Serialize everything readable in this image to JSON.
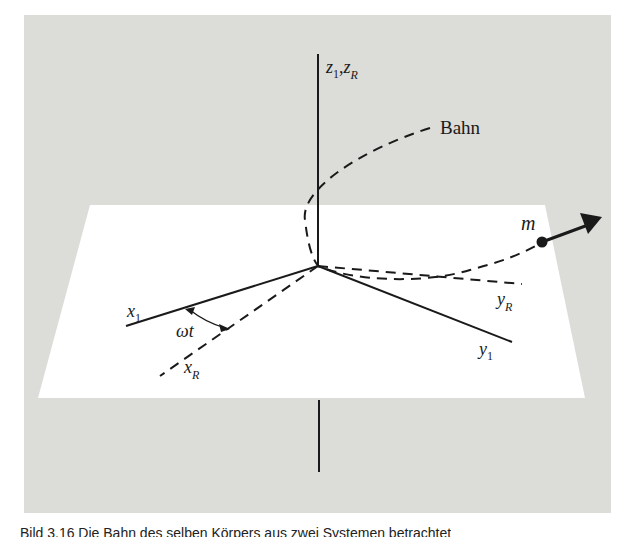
{
  "figure": {
    "background_color": "#dcdcd8",
    "plane_color": "#ffffff",
    "line_color": "#1a1a1a"
  },
  "labels": {
    "z_axis": {
      "main": "z",
      "sub1": "1",
      "sep": ",",
      "main2": "z",
      "sub2": "R"
    },
    "path": "Bahn",
    "mass": "m",
    "x1": {
      "main": "x",
      "sub": "1"
    },
    "xR": {
      "main": "x",
      "sub": "R"
    },
    "y1": {
      "main": "y",
      "sub": "1"
    },
    "yR": {
      "main": "y",
      "sub": "R"
    },
    "angle": "ωt"
  },
  "caption": {
    "text": "Bild 3.16  Die Bahn des selben Körpers aus zwei Systemen betrachtet",
    "note": "truncated at bottom edge"
  }
}
